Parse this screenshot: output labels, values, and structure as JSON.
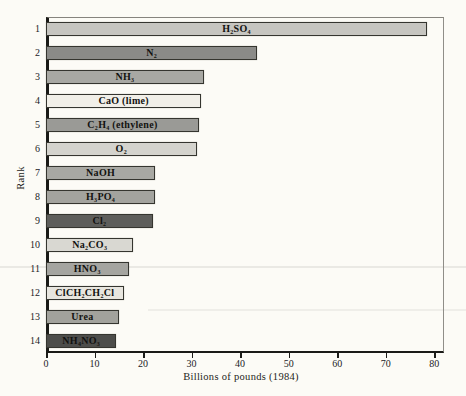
{
  "chart_data": {
    "type": "bar",
    "orientation": "horizontal",
    "title": "",
    "xlabel": "Billions of pounds (1984)",
    "ylabel": "Rank",
    "xlim": [
      0,
      82
    ],
    "xticks": [
      0,
      10,
      20,
      30,
      40,
      50,
      60,
      70,
      80
    ],
    "grid": false,
    "legend": "none",
    "categories": [
      "1",
      "2",
      "3",
      "4",
      "5",
      "6",
      "7",
      "8",
      "9",
      "10",
      "11",
      "12",
      "13",
      "14"
    ],
    "bars": [
      {
        "id": "h2so4",
        "rank": "1",
        "label": "H₂SO₄",
        "value": 78.5,
        "color": "#c6c5c0"
      },
      {
        "id": "n2",
        "rank": "2",
        "label": "N₂",
        "value": 43.5,
        "color": "#8b8b88"
      },
      {
        "id": "nh3",
        "rank": "3",
        "label": "NH₃",
        "value": 32.5,
        "color": "#a8a8a3"
      },
      {
        "id": "cao-lime",
        "rank": "4",
        "label": "CaO (lime)",
        "value": 32,
        "color": "#f1efe8"
      },
      {
        "id": "c2h4",
        "rank": "5",
        "label": "C₂H₄ (ethylene)",
        "value": 31.5,
        "color": "#9a9a96"
      },
      {
        "id": "o2",
        "rank": "6",
        "label": "O₂",
        "value": 31,
        "color": "#d4d3cd"
      },
      {
        "id": "naoh",
        "rank": "7",
        "label": "NaOH",
        "value": 22.5,
        "color": "#a8a8a3"
      },
      {
        "id": "h3po4",
        "rank": "8",
        "label": "H₃PO₄",
        "value": 22.5,
        "color": "#a3a39e"
      },
      {
        "id": "cl2",
        "rank": "9",
        "label": "Cl₂",
        "value": 22,
        "color": "#5e5e5b"
      },
      {
        "id": "na2co3",
        "rank": "10",
        "label": "Na₂CO₃",
        "value": 18,
        "color": "#d9d8d2"
      },
      {
        "id": "hno3",
        "rank": "11",
        "label": "HNO₃",
        "value": 17,
        "color": "#a5a5a0"
      },
      {
        "id": "clch2ch2cl",
        "rank": "12",
        "label": "ClCH₂CH₂Cl",
        "value": 16,
        "color": "#e8e6df"
      },
      {
        "id": "urea",
        "rank": "13",
        "label": "Urea",
        "value": 15,
        "color": "#a2a29c"
      },
      {
        "id": "nh4no3",
        "rank": "14",
        "label": "NH₄NO₃",
        "value": 14.5,
        "color": "#4d4d4a"
      }
    ]
  },
  "style": {
    "paper_color": "#fcfbf6",
    "bar_border_color": "#35352f",
    "axis_color": "#1a1a17",
    "text_color": "#1e1e1b"
  }
}
